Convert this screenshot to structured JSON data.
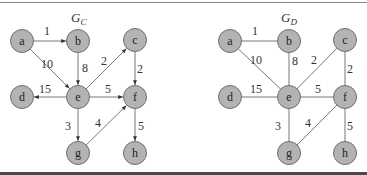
{
  "colors": {
    "node_fill": "#b3b3b3",
    "node_stroke": "#6f6f6f",
    "edge": "#555555",
    "text": "#333333",
    "top_rule": "#8a8a8a",
    "bottom_rule": "#4a4a4a"
  },
  "graphs": [
    {
      "id": "GC",
      "title_main": "G",
      "title_sub": "C",
      "directed": true,
      "nodes": [
        {
          "id": "a",
          "label": "a",
          "x": 22,
          "y": 41
        },
        {
          "id": "b",
          "label": "b",
          "x": 78,
          "y": 41
        },
        {
          "id": "c",
          "label": "c",
          "x": 135,
          "y": 40
        },
        {
          "id": "d",
          "label": "d",
          "x": 22,
          "y": 97
        },
        {
          "id": "e",
          "label": "e",
          "x": 78,
          "y": 97
        },
        {
          "id": "f",
          "label": "f",
          "x": 135,
          "y": 97
        },
        {
          "id": "g",
          "label": "g",
          "x": 78,
          "y": 153
        },
        {
          "id": "h",
          "label": "h",
          "x": 135,
          "y": 153
        }
      ],
      "edges": [
        {
          "from": "a",
          "to": "b",
          "weight": "1",
          "lx": 47,
          "ly": 35
        },
        {
          "from": "a",
          "to": "e",
          "weight": "10",
          "lx": 47,
          "ly": 68
        },
        {
          "from": "b",
          "to": "e",
          "weight": "8",
          "lx": 85,
          "ly": 72
        },
        {
          "from": "e",
          "to": "c",
          "weight": "2",
          "lx": 104,
          "ly": 65
        },
        {
          "from": "c",
          "to": "f",
          "weight": "2",
          "lx": 140,
          "ly": 73
        },
        {
          "from": "e",
          "to": "d",
          "weight": "15",
          "lx": 45,
          "ly": 93
        },
        {
          "from": "e",
          "to": "f",
          "weight": "5",
          "lx": 108,
          "ly": 93
        },
        {
          "from": "e",
          "to": "g",
          "weight": "3",
          "lx": 68,
          "ly": 130
        },
        {
          "from": "g",
          "to": "f",
          "weight": "4",
          "lx": 98,
          "ly": 127
        },
        {
          "from": "f",
          "to": "h",
          "weight": "5",
          "lx": 141,
          "ly": 130
        }
      ]
    },
    {
      "id": "GD",
      "title_main": "G",
      "title_sub": "D",
      "directed": false,
      "nodes": [
        {
          "id": "a",
          "label": "a",
          "x": 230,
          "y": 41
        },
        {
          "id": "b",
          "label": "b",
          "x": 289,
          "y": 41
        },
        {
          "id": "c",
          "label": "c",
          "x": 345,
          "y": 40
        },
        {
          "id": "d",
          "label": "d",
          "x": 230,
          "y": 97
        },
        {
          "id": "e",
          "label": "e",
          "x": 289,
          "y": 97
        },
        {
          "id": "f",
          "label": "f",
          "x": 345,
          "y": 97
        },
        {
          "id": "g",
          "label": "g",
          "x": 289,
          "y": 153
        },
        {
          "id": "h",
          "label": "h",
          "x": 345,
          "y": 153
        }
      ],
      "edges": [
        {
          "from": "a",
          "to": "b",
          "weight": "1",
          "lx": 255,
          "ly": 35
        },
        {
          "from": "a",
          "to": "e",
          "weight": "10",
          "lx": 256,
          "ly": 64
        },
        {
          "from": "b",
          "to": "e",
          "weight": "8",
          "lx": 295,
          "ly": 65
        },
        {
          "from": "e",
          "to": "c",
          "weight": "2",
          "lx": 314,
          "ly": 64
        },
        {
          "from": "c",
          "to": "f",
          "weight": "2",
          "lx": 350,
          "ly": 73
        },
        {
          "from": "e",
          "to": "d",
          "weight": "15",
          "lx": 256,
          "ly": 93
        },
        {
          "from": "e",
          "to": "f",
          "weight": "5",
          "lx": 318,
          "ly": 93
        },
        {
          "from": "e",
          "to": "g",
          "weight": "3",
          "lx": 278,
          "ly": 130
        },
        {
          "from": "g",
          "to": "f",
          "weight": "4",
          "lx": 308,
          "ly": 127
        },
        {
          "from": "f",
          "to": "h",
          "weight": "5",
          "lx": 350,
          "ly": 130
        }
      ]
    }
  ],
  "titles": [
    {
      "main": "G",
      "sub": "C",
      "x": 71,
      "y": 22
    },
    {
      "main": "G",
      "sub": "D",
      "x": 281,
      "y": 22
    }
  ]
}
